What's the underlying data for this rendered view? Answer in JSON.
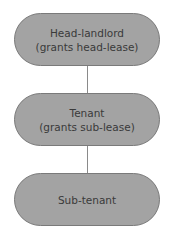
{
  "diagram": {
    "nodes": [
      {
        "line1": "Head-landlord",
        "line2": "(grants head-lease)"
      },
      {
        "line1": "Tenant",
        "line2": "(grants sub-lease)"
      },
      {
        "line1": "Sub-tenant",
        "line2": ""
      }
    ],
    "colors": {
      "node_fill": "#a3a3a3",
      "node_border": "#7a7a7a",
      "text": "#3a3a3a",
      "connector": "#8a8a8a"
    }
  }
}
